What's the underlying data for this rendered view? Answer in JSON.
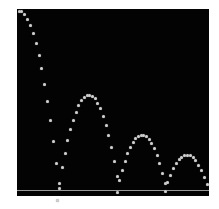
{
  "image": {
    "subject": "stroboscopic photograph of a bouncing ball",
    "background_color": "#030303",
    "ball_color": "#cfcfcf",
    "floor_color": "#9a9a9a",
    "frame": {
      "left": 17,
      "top": 9,
      "width": 192,
      "height": 187
    },
    "floor_y": 181
  },
  "trajectory": {
    "arcs": [
      {
        "start": [
          0,
          50
        ],
        "peak": [
          0,
          50
        ],
        "end": [
          40,
          179
        ]
      },
      {
        "start": [
          40,
          179
        ],
        "peak": [
          72,
          86
        ],
        "end": [
          100,
          179
        ]
      },
      {
        "start": [
          100,
          179
        ],
        "peak": [
          125,
          126
        ],
        "end": [
          148,
          179
        ]
      },
      {
        "start": [
          148,
          179
        ],
        "peak": [
          170,
          146
        ],
        "end": [
          190,
          179
        ]
      }
    ]
  }
}
